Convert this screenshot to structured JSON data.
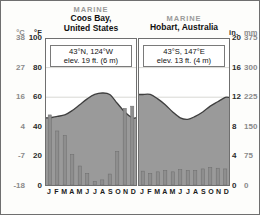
{
  "figure": {
    "left_axis": {
      "primary_unit": "°F",
      "secondary_unit": "°C",
      "celsius_ticks": [
        "38",
        "27",
        "16",
        "4",
        "-7",
        "-18"
      ],
      "fahrenheit_ticks": [
        "100",
        "80",
        "60",
        "40",
        "20",
        "0"
      ]
    },
    "right_axis": {
      "primary_unit": "in.",
      "secondary_unit": "mm",
      "inches_ticks": [
        "20",
        "16",
        "12",
        "8",
        "4",
        "0"
      ],
      "mm_ticks": [
        "375",
        "300",
        "225",
        "150",
        "75",
        "0"
      ]
    },
    "month_labels": [
      "J",
      "F",
      "M",
      "A",
      "M",
      "J",
      "J",
      "A",
      "S",
      "O",
      "N",
      "D"
    ],
    "colors": {
      "temperature_fill": "#9a9a9a",
      "precip_bar": "#8e8e8e",
      "frame": "#6f6f6f",
      "grid": "#d8d8d4",
      "muted_text": "#9a9a9a"
    }
  },
  "panels": [
    {
      "climate_type": "MARINE",
      "station": "Coos Bay,\nUnited States",
      "station_line1": "Coos Bay,",
      "station_line2": "United States",
      "coordinates": "43°N, 124°W",
      "elevation": "elev. 19 ft. (6 m)"
    },
    {
      "climate_type": "MARINE",
      "station": "Hobart, Australia",
      "station_line1": "Hobart, Australia",
      "station_line2": "",
      "coordinates": "43°S, 147°E",
      "elevation": "elev. 13 ft. (4 m)"
    }
  ],
  "chart_data": [
    {
      "type": "area",
      "title": "Coos Bay, United States",
      "subtitle": "MARINE",
      "xlabel": "",
      "ylabel": "Temperature / Precipitation",
      "categories": [
        "J",
        "F",
        "M",
        "A",
        "M",
        "J",
        "J",
        "A",
        "S",
        "O",
        "N",
        "D"
      ],
      "grid": true,
      "legend": "none",
      "series": [
        {
          "name": "Average temperature",
          "unit": "°F",
          "axis": "left",
          "ylim": [
            0,
            100
          ],
          "values": [
            46,
            47,
            48,
            51,
            55,
            59,
            62,
            63,
            62,
            56,
            50,
            46
          ]
        },
        {
          "name": "Average precipitation",
          "unit": "in.",
          "axis": "right",
          "ylim": [
            0,
            20
          ],
          "values": [
            9.6,
            7.4,
            6.8,
            4.2,
            2.6,
            1.6,
            0.5,
            0.7,
            1.5,
            4.6,
            10.5,
            10.8
          ]
        }
      ]
    },
    {
      "type": "area",
      "title": "Hobart, Australia",
      "subtitle": "MARINE",
      "xlabel": "",
      "ylabel": "Temperature / Precipitation",
      "categories": [
        "J",
        "F",
        "M",
        "A",
        "M",
        "J",
        "J",
        "A",
        "S",
        "O",
        "N",
        "D"
      ],
      "grid": true,
      "legend": "none",
      "series": [
        {
          "name": "Average temperature",
          "unit": "°F",
          "axis": "left",
          "ylim": [
            0,
            100
          ],
          "values": [
            62,
            62,
            59,
            55,
            50,
            46,
            45,
            47,
            50,
            54,
            57,
            60
          ]
        },
        {
          "name": "Average precipitation",
          "unit": "in.",
          "axis": "right",
          "ylim": [
            0,
            20
          ],
          "values": [
            1.9,
            1.6,
            1.8,
            2.0,
            1.8,
            2.1,
            2.0,
            2.0,
            2.2,
            2.4,
            2.3,
            2.2
          ]
        }
      ]
    }
  ]
}
